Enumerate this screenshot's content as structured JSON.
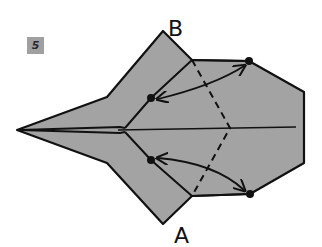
{
  "step": {
    "number": "5"
  },
  "labels": {
    "top": "B",
    "bottom": "A"
  },
  "colors": {
    "paper": "#a3a3a3",
    "line": "#111111",
    "badge": "#a0a0a0"
  },
  "diagram": {
    "points": {
      "tip": [
        17,
        130
      ],
      "B": [
        163,
        31
      ],
      "A": [
        163,
        224
      ],
      "dot_upper_inner": [
        151,
        98
      ],
      "dot_lower_inner": [
        151,
        160
      ],
      "dot_upper_outer": [
        249,
        61
      ],
      "dot_lower_outer": [
        250,
        194
      ]
    },
    "arrows": [
      {
        "from": "dot_upper_inner",
        "to": "dot_upper_outer",
        "type": "double-headed"
      },
      {
        "from": "dot_lower_inner",
        "to": "dot_lower_outer",
        "type": "double-headed"
      }
    ],
    "folds": [
      {
        "type": "valley",
        "style": "dashed",
        "path": "(192,60)-(230,128)-(192,196)"
      }
    ]
  }
}
